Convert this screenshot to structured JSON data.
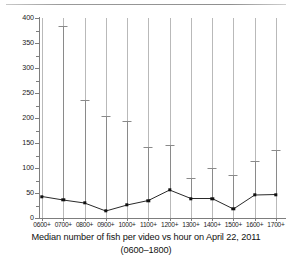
{
  "caption": {
    "line1": "Median number of fish per video vs hour on April 22, 2011",
    "line2": "(0600–1800)"
  },
  "chart_data": {
    "type": "line",
    "title": "Median number of fish per video vs hour on April 22, 2011 (0600–1800)",
    "xlabel": "",
    "ylabel": "",
    "categories": [
      "0600+",
      "0700+",
      "0800+",
      "0900+",
      "1000+",
      "1100+",
      "1200+",
      "1300+",
      "1400+",
      "1500+",
      "1600+",
      "1700+"
    ],
    "values": [
      43,
      36,
      30,
      14,
      26,
      35,
      56,
      39,
      39,
      18,
      46,
      47
    ],
    "error_upper": [
      43,
      385,
      237,
      205,
      195,
      143,
      146,
      80,
      100,
      87,
      114,
      136
    ],
    "series": [
      {
        "name": "Median fish per video",
        "values": [
          43,
          36,
          30,
          14,
          26,
          35,
          56,
          39,
          39,
          18,
          46,
          47
        ]
      }
    ],
    "ylim": [
      0,
      400
    ],
    "yticks": [
      0,
      50,
      100,
      150,
      200,
      250,
      300,
      350,
      400
    ],
    "ytick_labels": [
      "0",
      "50",
      "100",
      "150",
      "200",
      "250",
      "300",
      "350",
      "400"
    ],
    "yticks_minor": [
      25,
      75,
      125,
      175,
      225,
      275,
      325,
      375
    ],
    "xtick_labels": [
      "0600+",
      "0700+",
      "0800+",
      "0900+",
      "1000+",
      "1100+",
      "1200+",
      "1300+",
      "1400+",
      "1500+",
      "1600+",
      "1700+"
    ],
    "grid": "vertical-only",
    "legend": "none",
    "marker": "filled-square",
    "error_bar_style": "upper-whisker-with-cap",
    "colors": {
      "line": "#111111",
      "marker": "#111111",
      "error_bar": "#8a8a8a",
      "grid": "#b9b9b9",
      "axis": "#7d7d7d",
      "background": "#ffffff",
      "text": "#111111"
    }
  }
}
